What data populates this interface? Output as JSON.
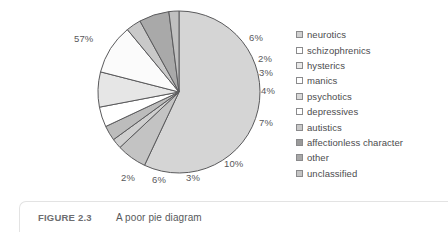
{
  "chart_data": {
    "type": "pie",
    "title": "",
    "subtitle": "",
    "xlabel": "",
    "ylabel": "",
    "legend_position": "right",
    "grid": false,
    "start_angle_deg": -90,
    "direction": "clockwise",
    "categories": [
      "neurotics",
      "schizophrenics",
      "hysterics",
      "manics",
      "psychotics",
      "depressives",
      "autistics",
      "affectionless character",
      "other",
      "unclassified"
    ],
    "values": [
      57,
      6,
      2,
      3,
      4,
      7,
      10,
      3,
      6,
      2
    ],
    "value_labels": [
      "57%",
      "6%",
      "2%",
      "3%",
      "4%",
      "7%",
      "10%",
      "3%",
      "6%",
      "2%"
    ],
    "slice_colors": [
      "#d5d5d5",
      "#c3c3c3",
      "#cfcfcf",
      "#bcbcbc",
      "#ffffff",
      "#e6e6e6",
      "#fbfbfb",
      "#c9c9c9",
      "#a9a9a9",
      "#c0c0c0"
    ],
    "slice_stroke": "#5a5a5c",
    "label_color": "#58585a"
  },
  "pie": {
    "center_x": 179,
    "center_y": 92,
    "radius": 81,
    "labels": [
      {
        "text": "57%",
        "x": 74,
        "y": 33
      },
      {
        "text": "6%",
        "x": 249,
        "y": 32
      },
      {
        "text": "2%",
        "x": 258,
        "y": 53
      },
      {
        "text": "3%",
        "x": 259,
        "y": 67
      },
      {
        "text": "4%",
        "x": 261,
        "y": 85
      },
      {
        "text": "7%",
        "x": 259,
        "y": 117
      },
      {
        "text": "10%",
        "x": 224,
        "y": 158
      },
      {
        "text": "3%",
        "x": 186,
        "y": 172
      },
      {
        "text": "6%",
        "x": 152,
        "y": 174
      },
      {
        "text": "2%",
        "x": 121,
        "y": 172
      }
    ]
  },
  "legend": {
    "items": [
      {
        "label": "neurotics",
        "swatch": "#d0d0d0"
      },
      {
        "label": "schizophrenics",
        "swatch": "#ffffff"
      },
      {
        "label": "hysterics",
        "swatch": "#e8e8e8"
      },
      {
        "label": "manics",
        "swatch": "#ffffff"
      },
      {
        "label": "psychotics",
        "swatch": "#d8d8d8"
      },
      {
        "label": "depressives",
        "swatch": "#ffffff"
      },
      {
        "label": "autistics",
        "swatch": "#c8c8c8"
      },
      {
        "label": "affectionless character",
        "swatch": "#9a9a9a"
      },
      {
        "label": "other",
        "swatch": "#a8a8a8"
      },
      {
        "label": "unclassified",
        "swatch": "#c4c4c4"
      }
    ]
  },
  "caption": {
    "figure_number": "FIGURE 2.3",
    "title": "A poor pie diagram"
  }
}
